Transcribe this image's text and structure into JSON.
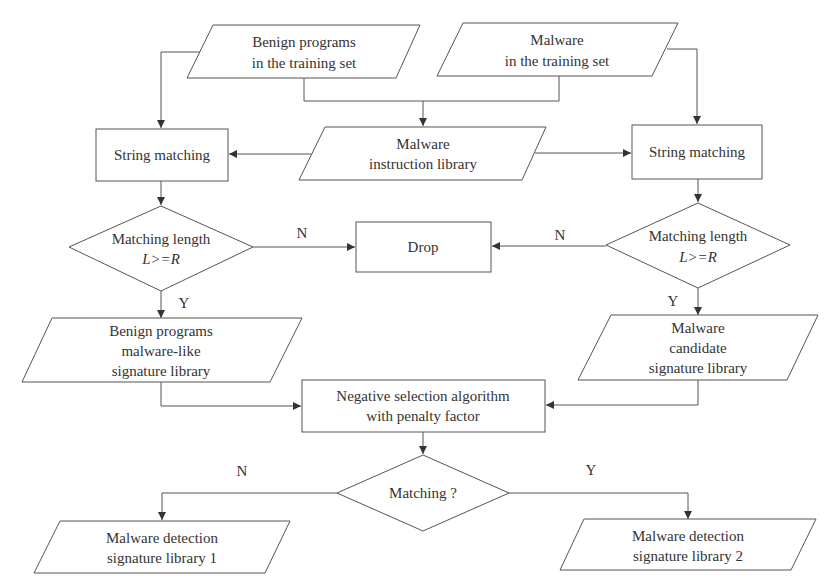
{
  "diagram": {
    "type": "flowchart",
    "nodes": {
      "benign_training": {
        "shape": "parallelogram",
        "lines": [
          "Benign programs",
          "in the training set"
        ]
      },
      "malware_training": {
        "shape": "parallelogram",
        "lines": [
          "Malware",
          "in the training set"
        ]
      },
      "instruction_library": {
        "shape": "parallelogram",
        "lines": [
          "Malware",
          "instruction library"
        ]
      },
      "string_matching_left": {
        "shape": "rectangle",
        "lines": [
          "String matching"
        ]
      },
      "string_matching_right": {
        "shape": "rectangle",
        "lines": [
          "String matching"
        ]
      },
      "length_check_left": {
        "shape": "diamond",
        "lines": [
          "Matching length",
          "L>=R"
        ]
      },
      "length_check_right": {
        "shape": "diamond",
        "lines": [
          "Matching length",
          "L>=R"
        ]
      },
      "drop": {
        "shape": "rectangle",
        "lines": [
          "Drop"
        ]
      },
      "benign_like_library": {
        "shape": "parallelogram",
        "lines": [
          "Benign programs",
          "malware-like",
          "signature library"
        ]
      },
      "candidate_library": {
        "shape": "parallelogram",
        "lines": [
          "Malware",
          "candidate",
          "signature library"
        ]
      },
      "negative_selection": {
        "shape": "rectangle",
        "lines": [
          "Negative selection algorithm",
          "with penalty factor"
        ]
      },
      "matching_check": {
        "shape": "diamond",
        "lines": [
          "Matching ?"
        ]
      },
      "detection_library_1": {
        "shape": "parallelogram",
        "lines": [
          "Malware detection",
          "signature library 1"
        ]
      },
      "detection_library_2": {
        "shape": "parallelogram",
        "lines": [
          "Malware detection",
          "signature library 2"
        ]
      }
    },
    "edge_labels": {
      "left_no": "N",
      "right_no": "N",
      "left_yes": "Y",
      "right_yes": "Y",
      "match_no": "N",
      "match_yes": "Y"
    },
    "edges": [
      {
        "from": "benign_training",
        "to": "string_matching_left"
      },
      {
        "from": "benign_training",
        "to": "instruction_library"
      },
      {
        "from": "malware_training",
        "to": "instruction_library"
      },
      {
        "from": "malware_training",
        "to": "string_matching_right"
      },
      {
        "from": "instruction_library",
        "to": "string_matching_left"
      },
      {
        "from": "instruction_library",
        "to": "string_matching_right"
      },
      {
        "from": "string_matching_left",
        "to": "length_check_left"
      },
      {
        "from": "string_matching_right",
        "to": "length_check_right"
      },
      {
        "from": "length_check_left",
        "to": "drop",
        "label": "N"
      },
      {
        "from": "length_check_right",
        "to": "drop",
        "label": "N"
      },
      {
        "from": "length_check_left",
        "to": "benign_like_library",
        "label": "Y"
      },
      {
        "from": "length_check_right",
        "to": "candidate_library",
        "label": "Y"
      },
      {
        "from": "benign_like_library",
        "to": "negative_selection"
      },
      {
        "from": "candidate_library",
        "to": "negative_selection"
      },
      {
        "from": "negative_selection",
        "to": "matching_check"
      },
      {
        "from": "matching_check",
        "to": "detection_library_1",
        "label": "N"
      },
      {
        "from": "matching_check",
        "to": "detection_library_2",
        "label": "Y"
      }
    ],
    "colors": {
      "stroke": "#555555",
      "text": "#333333",
      "background": "#ffffff"
    }
  }
}
